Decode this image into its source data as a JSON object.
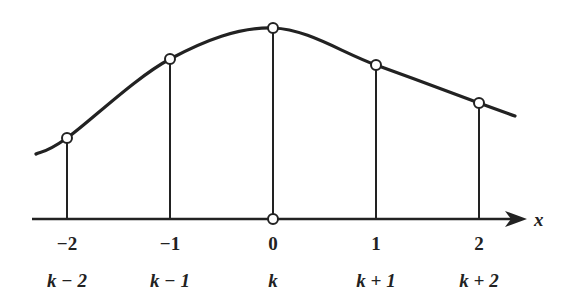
{
  "diagram": {
    "type": "sampled-curve",
    "colors": {
      "stroke": "#222222",
      "background": "#ffffff",
      "marker_fill": "#ffffff"
    },
    "axis": {
      "label": "x",
      "y": 219,
      "x_start": 32,
      "x_end": 527
    },
    "origin_marker": {
      "x": 273,
      "y": 219
    },
    "curve": {
      "start": {
        "x": 36,
        "y": 154
      },
      "end": {
        "x": 515,
        "y": 116
      }
    },
    "samples": [
      {
        "index": "-2",
        "label": "k − 2",
        "px": 67,
        "py": 138
      },
      {
        "index": "-1",
        "label": "k − 1",
        "px": 170,
        "py": 59
      },
      {
        "index": "0",
        "label": "k",
        "px": 273,
        "py": 28
      },
      {
        "index": "1",
        "label": "k + 1",
        "px": 376,
        "py": 65
      },
      {
        "index": "2",
        "label": "k + 2",
        "px": 479,
        "py": 103
      }
    ],
    "tick_labels": [
      "−2",
      "−1",
      "0",
      "1",
      "2"
    ],
    "k_labels": [
      "k − 2",
      "k − 1",
      "k",
      "k + 1",
      "k + 2"
    ]
  }
}
